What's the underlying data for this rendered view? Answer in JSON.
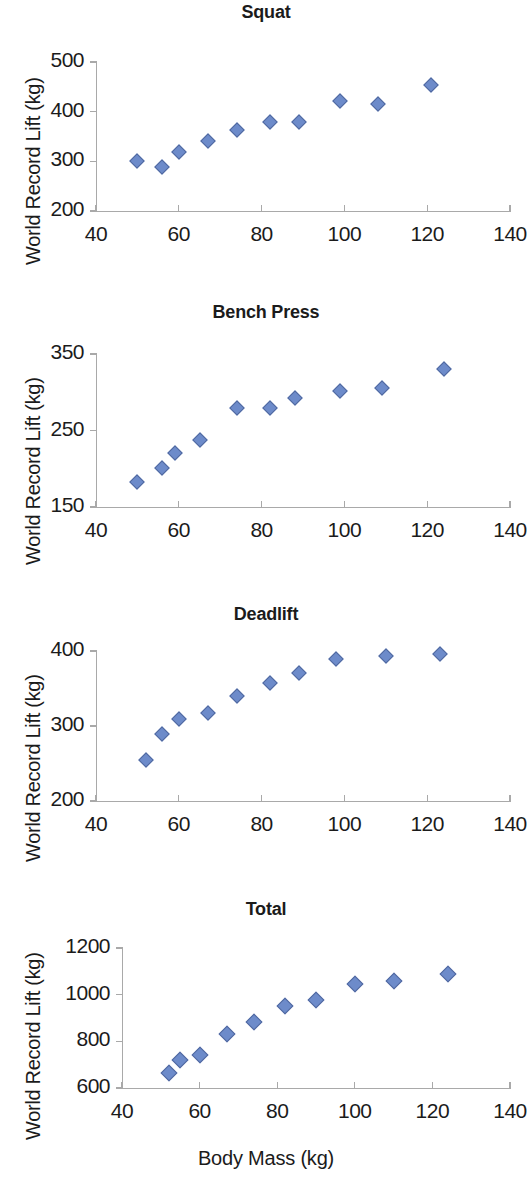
{
  "axis_common": {
    "xlabel": "Body Mass (kg)",
    "ylabel": "World Record Lift (kg)",
    "xticks": [
      "40",
      "60",
      "80",
      "100",
      "120",
      "140"
    ],
    "xmin": 40,
    "xmax": 140,
    "marker_color": "#6d8bca",
    "axis_color": "#a9a9a9"
  },
  "panels": [
    {
      "title": "Squat",
      "yticks": [
        "200",
        "300",
        "400",
        "500"
      ],
      "ymin": 200,
      "ymax": 500
    },
    {
      "title": "Bench Press",
      "yticks": [
        "150",
        "250",
        "350"
      ],
      "ymin": 150,
      "ymax": 350
    },
    {
      "title": "Deadlift",
      "yticks": [
        "200",
        "300",
        "400"
      ],
      "ymin": 200,
      "ymax": 400
    },
    {
      "title": "Total",
      "yticks": [
        "600",
        "800",
        "1000",
        "1200"
      ],
      "ymin": 600,
      "ymax": 1200
    }
  ],
  "chart_data": [
    {
      "type": "scatter",
      "title": "Squat",
      "xlabel": "Body Mass (kg)",
      "ylabel": "World Record Lift (kg)",
      "xlim": [
        40,
        140
      ],
      "ylim": [
        200,
        500
      ],
      "xticks": [
        40,
        60,
        80,
        100,
        120,
        140
      ],
      "yticks": [
        200,
        300,
        400,
        500
      ],
      "grid": false,
      "legend": "none",
      "series": [
        {
          "name": "Squat world records",
          "points": [
            [
              50,
              300
            ],
            [
              56,
              288
            ],
            [
              60,
              318
            ],
            [
              67,
              341
            ],
            [
              74,
              363
            ],
            [
              82,
              380
            ],
            [
              89,
              379
            ],
            [
              99,
              421
            ],
            [
              108,
              416
            ],
            [
              121,
              453
            ]
          ]
        }
      ]
    },
    {
      "type": "scatter",
      "title": "Bench Press",
      "xlabel": "Body Mass (kg)",
      "ylabel": "World Record Lift (kg)",
      "xlim": [
        40,
        140
      ],
      "ylim": [
        150,
        350
      ],
      "xticks": [
        40,
        60,
        80,
        100,
        120,
        140
      ],
      "yticks": [
        150,
        250,
        350
      ],
      "grid": false,
      "legend": "none",
      "series": [
        {
          "name": "Bench press world records",
          "points": [
            [
              50,
              183
            ],
            [
              56,
              201
            ],
            [
              59,
              220
            ],
            [
              65,
              237
            ],
            [
              74,
              279
            ],
            [
              82,
              279
            ],
            [
              88,
              292
            ],
            [
              99,
              302
            ],
            [
              109,
              306
            ],
            [
              124,
              331
            ]
          ]
        }
      ]
    },
    {
      "type": "scatter",
      "title": "Deadlift",
      "xlabel": "Body Mass (kg)",
      "ylabel": "World Record Lift (kg)",
      "xlim": [
        40,
        140
      ],
      "ylim": [
        200,
        400
      ],
      "xticks": [
        40,
        60,
        80,
        100,
        120,
        140
      ],
      "yticks": [
        200,
        300,
        400
      ],
      "grid": false,
      "legend": "none",
      "series": [
        {
          "name": "Deadlift world records",
          "points": [
            [
              52,
              255
            ],
            [
              56,
              290
            ],
            [
              60,
              309
            ],
            [
              67,
              317
            ],
            [
              74,
              340
            ],
            [
              82,
              357
            ],
            [
              89,
              371
            ],
            [
              98,
              389
            ],
            [
              110,
              394
            ],
            [
              123,
              396
            ]
          ]
        }
      ]
    },
    {
      "type": "scatter",
      "title": "Total",
      "xlabel": "Body Mass (kg)",
      "ylabel": "World Record Lift (kg)",
      "xlim": [
        40,
        140
      ],
      "ylim": [
        600,
        1200
      ],
      "xticks": [
        40,
        60,
        80,
        100,
        120,
        140
      ],
      "yticks": [
        600,
        800,
        1000,
        1200
      ],
      "grid": false,
      "legend": "none",
      "series": [
        {
          "name": "Total world records",
          "points": [
            [
              52,
              665
            ],
            [
              55,
              720
            ],
            [
              60,
              740
            ],
            [
              67,
              833
            ],
            [
              74,
              885
            ],
            [
              82,
              952
            ],
            [
              90,
              977
            ],
            [
              100,
              1045
            ],
            [
              110,
              1060
            ],
            [
              124,
              1090
            ]
          ]
        }
      ]
    }
  ]
}
